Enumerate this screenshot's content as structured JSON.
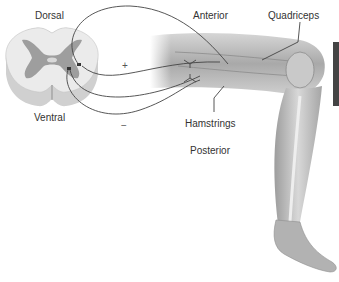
{
  "diagram": {
    "labels": {
      "dorsal": "Dorsal",
      "ventral": "Ventral",
      "anterior": "Anterior",
      "quadriceps": "Quadriceps",
      "hamstrings": "Hamstrings",
      "posterior": "Posterior"
    },
    "signs": {
      "excitatory": "+",
      "inhibitory": "−"
    },
    "colors": {
      "nerve_line": "#444444",
      "gray_matter": "#9a9a9a",
      "white_matter": "#e4e4e4",
      "leg_tone": "#b8b8b8",
      "label_text": "#333333"
    }
  }
}
